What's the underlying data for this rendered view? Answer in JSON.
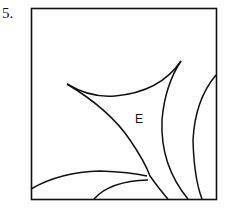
{
  "problem": {
    "number": "5."
  },
  "diagram": {
    "region_label": "E",
    "stroke_color": "#111111",
    "background": "#ffffff",
    "frame": {
      "x": 31,
      "y": 8,
      "width": 185,
      "height": 191
    }
  }
}
